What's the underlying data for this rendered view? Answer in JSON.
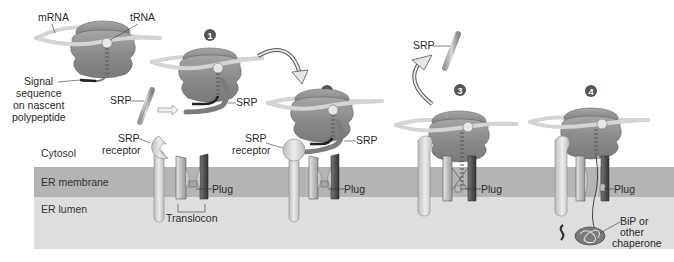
{
  "figure": {
    "regions": {
      "cytosol": "Cytosol",
      "er_membrane": "ER membrane",
      "er_lumen": "ER lumen"
    },
    "labels": {
      "mrna": "mRNA",
      "trna": "tRNA",
      "signal_line1": "Signal",
      "signal_line2": "sequence",
      "signal_line3": "on nascent",
      "signal_line4": "polypeptide",
      "srp_free": "SRP",
      "srp_receptor_line1": "SRP",
      "srp_receptor_line2": "receptor",
      "plug": "Plug",
      "translocon": "Translocon",
      "srp_step1": "SRP",
      "srp_receptor2_line1": "SRP",
      "srp_receptor2_line2": "receptor",
      "srp_step2": "SRP",
      "plug_step2": "Plug",
      "srp_step3": "SRP",
      "plug_step3": "Plug",
      "plug_step4": "Plug",
      "bip_line1": "BiP or",
      "bip_line2": "other",
      "bip_line3": "chaperone"
    },
    "steps": [
      "1",
      "2",
      "3",
      "4"
    ],
    "colors": {
      "membrane": "#b4b4b4",
      "lumen": "#dedede",
      "ribosome": "#8f8f8f",
      "mrna": "#d4d4d4",
      "step_badge": "#555555",
      "translocon_dark": "#4a4a4a",
      "translocon_light": "#c8c8c8"
    }
  }
}
